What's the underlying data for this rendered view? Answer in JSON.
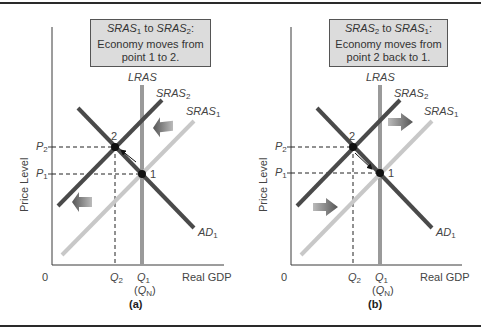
{
  "panels": [
    {
      "id": "a",
      "tag": "(a)",
      "note": {
        "from_curve": "SRAS",
        "from_sub": "1",
        "to_word": " to ",
        "to_curve": "SRAS",
        "to_sub": "2",
        "colon": ":",
        "line2": "Economy moves from",
        "line3": "point 1 to 2."
      },
      "curves": {
        "lras": "LRAS",
        "sras2": "SRAS",
        "sras2_sub": "2",
        "sras1": "SRAS",
        "sras1_sub": "1",
        "ad": "AD",
        "ad_sub": "1"
      },
      "axes": {
        "ylabel": "Price Level",
        "xlabel": "Real GDP",
        "origin": "0",
        "p2": "P",
        "p2_sub": "2",
        "p1": "P",
        "p1_sub": "1",
        "q2": "Q",
        "q2_sub": "2",
        "q1": "Q",
        "q1_sub": "1",
        "qn_open": "(",
        "qn": "Q",
        "qn_sub": "N",
        "qn_close": ")"
      },
      "points": {
        "point2": "2",
        "point1": "1"
      },
      "shift_direction": "left"
    },
    {
      "id": "b",
      "tag": "(b)",
      "note": {
        "from_curve": "SRAS",
        "from_sub": "2",
        "to_word": " to ",
        "to_curve": "SRAS",
        "to_sub": "1",
        "colon": ":",
        "line2": "Economy moves from",
        "line3": "point 2 back to 1."
      },
      "curves": {
        "lras": "LRAS",
        "sras2": "SRAS",
        "sras2_sub": "2",
        "sras1": "SRAS",
        "sras1_sub": "1",
        "ad": "AD",
        "ad_sub": "1"
      },
      "axes": {
        "ylabel": "Price Level",
        "xlabel": "Real GDP",
        "origin": "0",
        "p2": "P",
        "p2_sub": "2",
        "p1": "P",
        "p1_sub": "1",
        "q2": "Q",
        "q2_sub": "2",
        "q1": "Q",
        "q1_sub": "1",
        "qn_open": "(",
        "qn": "Q",
        "qn_sub": "N",
        "qn_close": ")"
      },
      "points": {
        "point2": "2",
        "point1": "1"
      },
      "shift_direction": "right"
    }
  ],
  "colors": {
    "axis": "#3a3a3a",
    "lras": "#9a9a9a",
    "sras2": "#4a4a4a",
    "sras1": "#c8c8c8",
    "ad": "#4a4a4a",
    "point": "#111111",
    "note_bg": "#dcdcdc",
    "shift_arrow": "#666666"
  }
}
